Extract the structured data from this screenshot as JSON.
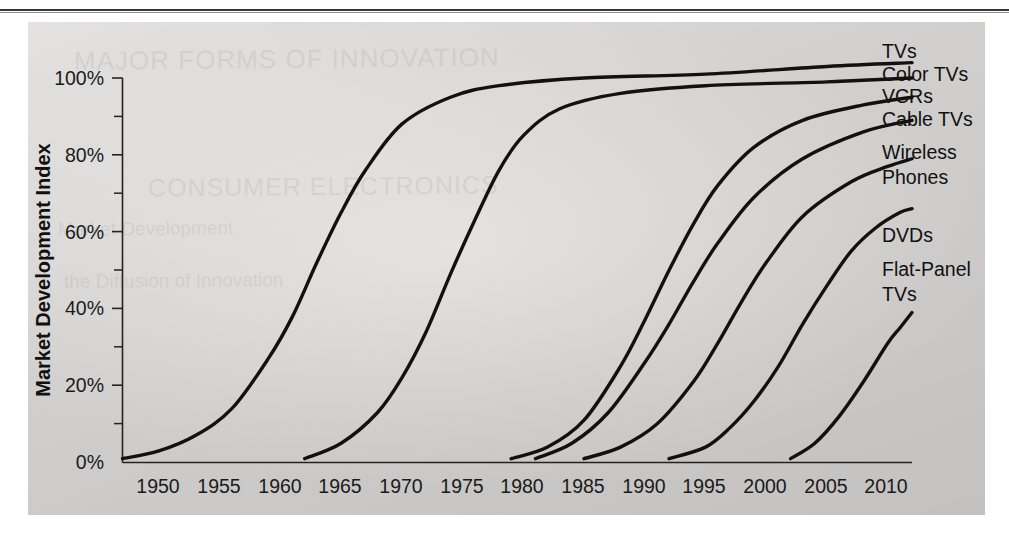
{
  "page": {
    "rule_present": true,
    "panel_bg": "#d8d7d5",
    "ghost_text": [
      "MAJOR FORMS OF INNOVATION",
      "CONSUMER ELECTRONICS",
      "Market Development",
      "the Diffusion of Innovation"
    ]
  },
  "chart_data": {
    "type": "line",
    "title": "",
    "subtitle": "",
    "xlabel": "",
    "ylabel": "Market Development Index",
    "grid": false,
    "legend_position": "right-inline-labels",
    "xlim": [
      1947,
      2012
    ],
    "ylim": [
      0,
      105
    ],
    "x_tick_labels": [
      "1950",
      "1955",
      "1960",
      "1965",
      "1970",
      "1975",
      "1980",
      "1985",
      "1990",
      "1995",
      "2000",
      "2005",
      "2010"
    ],
    "x_ticks": [
      1950,
      1955,
      1960,
      1965,
      1970,
      1975,
      1980,
      1985,
      1990,
      1995,
      2000,
      2005,
      2010
    ],
    "y_tick_labels": [
      "0%",
      "20%",
      "40%",
      "60%",
      "80%",
      "100%"
    ],
    "y_ticks": [
      0,
      20,
      40,
      60,
      80,
      100
    ],
    "y_minor_ticks": [
      10,
      30,
      50,
      70,
      90
    ],
    "series": [
      {
        "name": "TVs",
        "label": "TVs",
        "color": "#111111",
        "start_year": 1947,
        "x": [
          1947,
          1950,
          1953,
          1956,
          1959,
          1961,
          1963,
          1965,
          1967,
          1970,
          1974,
          1978,
          1985,
          1995,
          2005,
          2012
        ],
        "values": [
          1,
          3,
          7,
          14,
          27,
          38,
          52,
          65,
          76,
          88,
          95,
          98,
          100,
          101,
          103,
          104
        ]
      },
      {
        "name": "Color TVs",
        "label": "Color TVs",
        "color": "#111111",
        "start_year": 1962,
        "x": [
          1962,
          1965,
          1968,
          1970,
          1972,
          1974,
          1976,
          1978,
          1980,
          1983,
          1988,
          1995,
          2005,
          2012
        ],
        "values": [
          1,
          5,
          13,
          22,
          34,
          49,
          63,
          76,
          85,
          92,
          96,
          98,
          99,
          100
        ]
      },
      {
        "name": "VCRs",
        "label": "VCRs",
        "color": "#111111",
        "start_year": 1979,
        "x": [
          1979,
          1982,
          1985,
          1988,
          1990,
          1992,
          1994,
          1996,
          1999,
          2003,
          2008,
          2012
        ],
        "values": [
          1,
          4,
          11,
          25,
          37,
          50,
          62,
          72,
          82,
          89,
          93,
          95
        ]
      },
      {
        "name": "Cable TVs",
        "label": "Cable TVs",
        "color": "#111111",
        "start_year": 1981,
        "x": [
          1981,
          1984,
          1987,
          1990,
          1992,
          1994,
          1996,
          1999,
          2003,
          2008,
          2012
        ],
        "values": [
          1,
          5,
          13,
          26,
          36,
          47,
          57,
          69,
          79,
          86,
          89
        ]
      },
      {
        "name": "Wireless Phones",
        "label": "Wireless\nPhones",
        "label_lines": [
          "Wireless",
          "Phones"
        ],
        "color": "#111111",
        "start_year": 1985,
        "x": [
          1985,
          1988,
          1991,
          1994,
          1996,
          1998,
          2000,
          2003,
          2007,
          2010,
          2012
        ],
        "values": [
          1,
          4,
          10,
          21,
          31,
          42,
          52,
          64,
          73,
          77,
          79
        ]
      },
      {
        "name": "DVDs",
        "label": "DVDs",
        "color": "#111111",
        "start_year": 1992,
        "x": [
          1992,
          1995,
          1997,
          1999,
          2001,
          2003,
          2005,
          2007,
          2009,
          2011,
          2012
        ],
        "values": [
          1,
          4,
          9,
          16,
          25,
          36,
          46,
          55,
          61,
          65,
          66
        ]
      },
      {
        "name": "Flat-Panel TVs",
        "label": "Flat-Panel\nTVs",
        "label_lines": [
          "Flat-Panel",
          "TVs"
        ],
        "color": "#111111",
        "start_year": 2002,
        "x": [
          2002,
          2004,
          2006,
          2008,
          2010,
          2011,
          2012
        ],
        "values": [
          1,
          5,
          12,
          21,
          31,
          35,
          39
        ]
      }
    ]
  }
}
